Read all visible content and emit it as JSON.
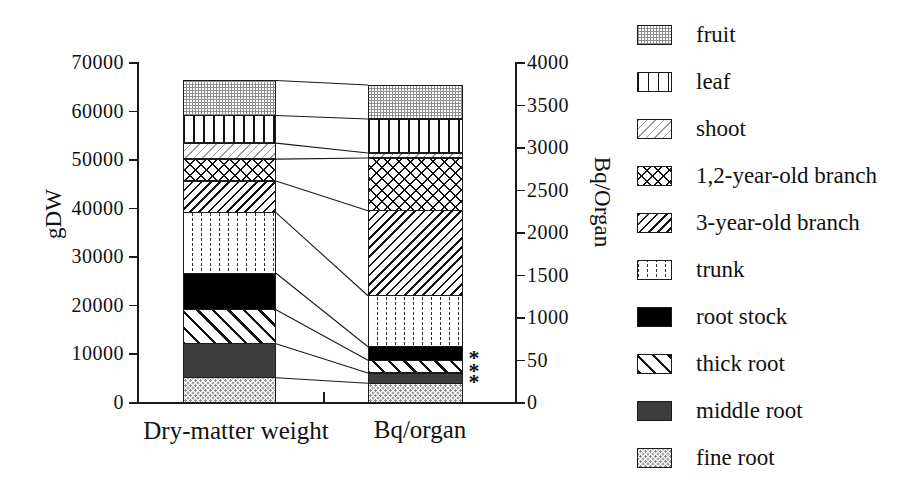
{
  "colors": {
    "ink": "#1a1a1a",
    "background": "#ffffff",
    "pattern_gray": "#8e8e8e",
    "middle_root_gray": "#3d3d3d"
  },
  "chart_data": {
    "type": "bar",
    "subtype": "paired-stacked-bars-with-connectors",
    "title": "",
    "categories": [
      "Dry-matter weight",
      "Bq/organ"
    ],
    "left_axis": {
      "label": "gDW",
      "min": 0,
      "max": 70000,
      "ticks": [
        {
          "label": "70000",
          "value": 70000
        },
        {
          "label": "60000",
          "value": 60000
        },
        {
          "label": "50000",
          "value": 50000
        },
        {
          "label": "40000",
          "value": 40000
        },
        {
          "label": "30000",
          "value": 30000
        },
        {
          "label": "20000",
          "value": 20000
        },
        {
          "label": "10000",
          "value": 10000
        },
        {
          "label": "0",
          "value": 0
        }
      ]
    },
    "right_axis": {
      "label": "Bq/Organ",
      "min": 0,
      "max": 4000,
      "ticks": [
        {
          "label": "4000",
          "value": 4000
        },
        {
          "label": "3500",
          "value": 3500
        },
        {
          "label": "3000",
          "value": 3000
        },
        {
          "label": "2500",
          "value": 2500
        },
        {
          "label": "2000",
          "value": 2000
        },
        {
          "label": "1500",
          "value": 1500
        },
        {
          "label": "1000",
          "value": 1000
        },
        {
          "label": "50",
          "value": 500
        },
        {
          "label": "0",
          "value": 0
        }
      ]
    },
    "series_bottom_to_top": [
      {
        "name": "fine root",
        "pattern": "dot-stipple",
        "dry_matter_gdw": 5000,
        "bq_per_organ": 220
      },
      {
        "name": "middle root",
        "pattern": "dark-gray",
        "dry_matter_gdw": 7000,
        "bq_per_organ": 120
      },
      {
        "name": "thick root",
        "pattern": "diag-back",
        "dry_matter_gdw": 7000,
        "bq_per_organ": 150
      },
      {
        "name": "root stock",
        "pattern": "solid-black",
        "dry_matter_gdw": 7500,
        "bq_per_organ": 160
      },
      {
        "name": "trunk",
        "pattern": "vdots",
        "dry_matter_gdw": 12500,
        "bq_per_organ": 600
      },
      {
        "name": "3-year-old branch",
        "pattern": "diag-fwd",
        "dry_matter_gdw": 6500,
        "bq_per_organ": 1000
      },
      {
        "name": "1,2-year-old branch",
        "pattern": "crosshatch",
        "dry_matter_gdw": 4500,
        "bq_per_organ": 620
      },
      {
        "name": "shoot",
        "pattern": "light-diag",
        "dry_matter_gdw": 3300,
        "bq_per_organ": 60
      },
      {
        "name": "leaf",
        "pattern": "vlines",
        "dry_matter_gdw": 5700,
        "bq_per_organ": 400
      },
      {
        "name": "fruit",
        "pattern": "gray-grid",
        "dry_matter_gdw": 7200,
        "bq_per_organ": 400
      }
    ],
    "totals": {
      "dry_matter_gdw": 66200,
      "bq_per_organ": 3730
    },
    "significance_marks": [
      {
        "symbol": "*",
        "series": "root stock"
      },
      {
        "symbol": "*",
        "series": "thick root"
      },
      {
        "symbol": "*",
        "series": "middle root"
      }
    ]
  },
  "legend": {
    "items_top_to_bottom": [
      {
        "label": "fruit"
      },
      {
        "label": "leaf"
      },
      {
        "label": "shoot"
      },
      {
        "label": "1,2-year-old branch"
      },
      {
        "label": "3-year-old branch"
      },
      {
        "label": "trunk"
      },
      {
        "label": "root stock"
      },
      {
        "label": "thick root"
      },
      {
        "label": "middle root"
      },
      {
        "label": "fine root"
      }
    ]
  }
}
